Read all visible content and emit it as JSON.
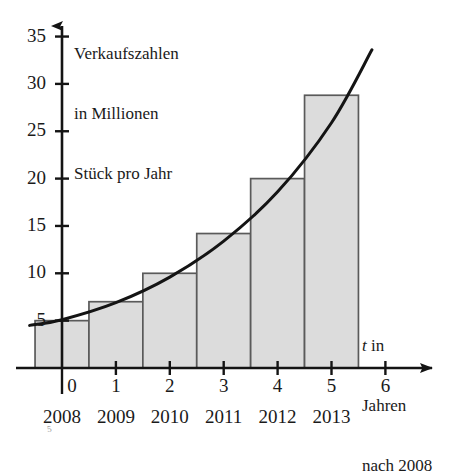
{
  "chart_data": {
    "type": "bar",
    "title": "",
    "subtitle": "",
    "ylabel": "Verkaufszahlen in Millionen Stück pro Jahr",
    "ylabel_lines": [
      "Verkaufszahlen",
      "in Millionen",
      "Stück pro Jahr"
    ],
    "xlabel": "t in Jahren nach 2008",
    "xlabel_lines": [
      "t in",
      "Jahren",
      "nach 2008"
    ],
    "xlabel_italic_token": "t",
    "categories": [
      "0",
      "1",
      "2",
      "3",
      "4",
      "5"
    ],
    "secondary_categories": [
      "2008",
      "2009",
      "2010",
      "2011",
      "2012",
      "2013"
    ],
    "values": [
      5,
      7,
      10,
      14.2,
      20,
      28.8
    ],
    "xticks": [
      "0",
      "1",
      "2",
      "3",
      "4",
      "5",
      "6"
    ],
    "yticks": [
      "5",
      "10",
      "15",
      "20",
      "25",
      "30",
      "35"
    ],
    "xlim": [
      -0.6,
      6.45
    ],
    "ylim": [
      0,
      38.5
    ],
    "grid": false,
    "legend": null,
    "series": [
      {
        "name": "Verkaufszahlen",
        "type": "bar",
        "values": [
          5,
          7,
          10,
          14.2,
          20,
          28.8
        ]
      },
      {
        "name": "Exponentielles Modell",
        "type": "line",
        "note": "exponentielle Ausgleichskurve",
        "points": [
          {
            "t": -0.6,
            "y": 4.5
          },
          {
            "t": 0,
            "y": 5.1
          },
          {
            "t": 1,
            "y": 6.9
          },
          {
            "t": 2,
            "y": 9.6
          },
          {
            "t": 3,
            "y": 13.4
          },
          {
            "t": 4,
            "y": 18.6
          },
          {
            "t": 5,
            "y": 25.9
          },
          {
            "t": 5.75,
            "y": 33.6
          }
        ]
      }
    ],
    "bar_fill": "#dcdcdc",
    "bar_stroke": "#5a5a5a",
    "curve_color": "#141414",
    "axis_color": "#141414"
  },
  "artifact": {
    "smudge_text": "5"
  }
}
